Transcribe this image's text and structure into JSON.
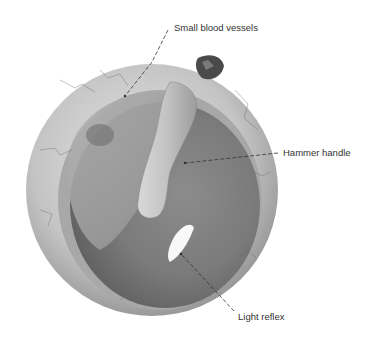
{
  "diagram": {
    "labels": [
      {
        "id": "small-blood-vessels",
        "text": "Small blood vessels"
      },
      {
        "id": "hammer-handle",
        "text": "Hammer handle"
      },
      {
        "id": "light-reflex",
        "text": "Light reflex"
      }
    ],
    "colors": {
      "background": "#ffffff",
      "rim": "#bdbdbd",
      "membrane": "#8a8a8a",
      "leader": "#333333",
      "text": "#333333"
    }
  }
}
